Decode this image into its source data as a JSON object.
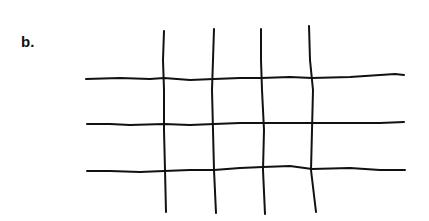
{
  "figure": {
    "panel_label": "b.",
    "stroke_color": "#111111",
    "background_color": "#ffffff",
    "vertical_lines": [
      {
        "id": "v1",
        "points": "164,31 163,60 164,90 164,130 165,170 166,212"
      },
      {
        "id": "v2",
        "points": "214,29 213,60 212,90 213,130 214,170 216,213"
      },
      {
        "id": "v3",
        "points": "261,29 261,60 262,90 264,130 263,170 265,214"
      },
      {
        "id": "v4",
        "points": "309,26 310,60 313,90 312,130 311,170 316,212"
      }
    ],
    "horizontal_lines": [
      {
        "id": "h1",
        "points": "86,79 120,78 150,79 164,78 190,80 214,79 240,78 261,78 290,77 312,78 350,77 380,75 395,74 404,75"
      },
      {
        "id": "h2",
        "points": "87,124 110,124 130,125 164,124 190,125 214,124 240,123 264,123 290,123 312,123 350,123 380,123 404,122"
      },
      {
        "id": "h3",
        "points": "87,171 110,171 140,172 164,171 190,170 214,170 240,168 263,167 290,166 312,169 350,168 380,170 405,170"
      }
    ]
  }
}
